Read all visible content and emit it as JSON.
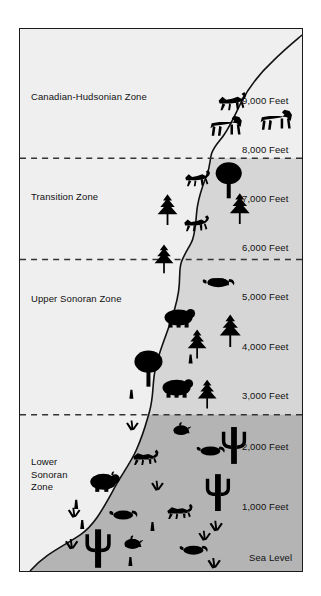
{
  "figure": {
    "title": "Ecozones of the Cahuilla",
    "frame": {
      "border_color": "#1a1a1a",
      "background": "#f0f0f0"
    }
  },
  "colors": {
    "sky": "#f0f0f0",
    "zone_light": "#efefef",
    "zone_mid": "#d6d6d6",
    "zone_dark": "#b4b4b4",
    "mountain_outline": "#111111",
    "dashed_boundary": "#333333",
    "silhouette": "#000000",
    "text": "#111111"
  },
  "zones": [
    {
      "name": "Canadian-Hudsonian Zone",
      "label_x": 11,
      "label_y": 62,
      "fill": "#efefef"
    },
    {
      "name": "Transition Zone",
      "label_x": 11,
      "label_y": 162,
      "fill": "#d6d6d6"
    },
    {
      "name": "Upper Sonoran Zone",
      "label_x": 11,
      "label_y": 264,
      "fill": "#d6d6d6"
    },
    {
      "name": "Lower\nSonoran\nZone",
      "label_x": 11,
      "label_y": 427,
      "fill": "#b4b4b4"
    }
  ],
  "boundaries": [
    {
      "label": "Canadian-Hudsonian / Transition",
      "y": 129
    },
    {
      "label": "Transition / Upper Sonoran",
      "y": 230
    },
    {
      "label": "Upper Sonoran / Lower Sonoran",
      "y": 385
    }
  ],
  "elevations": [
    {
      "label": "9,000 Feet",
      "x": 222,
      "y": 66
    },
    {
      "label": "8,000 Feet",
      "x": 222,
      "y": 115
    },
    {
      "label": "7,000 Feet",
      "x": 222,
      "y": 164
    },
    {
      "label": "6,000 Feet",
      "x": 222,
      "y": 213
    },
    {
      "label": "5,000 Feet",
      "x": 222,
      "y": 262
    },
    {
      "label": "4,000 Feet",
      "x": 222,
      "y": 312
    },
    {
      "label": "3,000 Feet",
      "x": 222,
      "y": 361
    },
    {
      "label": "2,000 Feet",
      "x": 222,
      "y": 412
    },
    {
      "label": "1,000 Feet",
      "x": 222,
      "y": 472
    },
    {
      "label": "Sea Level",
      "x": 229,
      "y": 523
    }
  ],
  "wildlife": {
    "canadian_hudsonian": [
      "deer-silhouette",
      "bighorn-sheep-silhouette",
      "bighorn-sheep-silhouette"
    ],
    "transition": [
      "deer-silhouette",
      "oak-tree-silhouette",
      "pine-tree-silhouette",
      "pine-tree-silhouette",
      "deer-silhouette",
      "pine-tree-silhouette"
    ],
    "upper_sonoran": [
      "squirrel-silhouette",
      "bear-silhouette",
      "pine-tree-silhouette",
      "pine-tree-silhouette",
      "oak-tree-silhouette",
      "bear-silhouette",
      "pine-tree-silhouette",
      "agave-silhouette",
      "agave-silhouette"
    ],
    "lower_sonoran": [
      "bush-silhouette",
      "quail-silhouette",
      "jackrabbit-silhouette",
      "rodent-silhouette",
      "cactus-silhouette",
      "rabbit-silhouette",
      "bush-silhouette",
      "cactus-silhouette",
      "bush-silhouette",
      "rodent-silhouette",
      "jackrabbit-silhouette",
      "agave-silhouette",
      "quail-silhouette",
      "bush-silhouette",
      "rodent-silhouette",
      "bush-silhouette",
      "cactus-silhouette",
      "bush-silhouette",
      "agave-silhouette"
    ]
  }
}
